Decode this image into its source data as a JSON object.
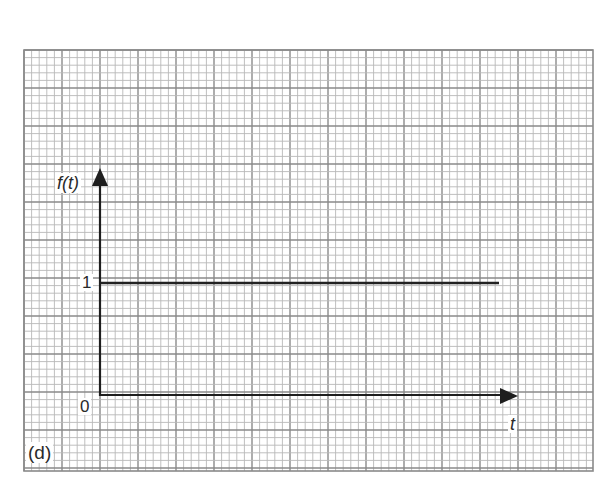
{
  "figure": {
    "panel_label": "(d)",
    "y_axis_label": "f(t)",
    "x_axis_label": "t",
    "y_tick_labels": [
      {
        "text": "1",
        "value": 1
      },
      {
        "text": "0",
        "value": 0
      }
    ]
  },
  "grid": {
    "left": 24,
    "top": 50,
    "right": 593,
    "bottom": 471,
    "minor_pitch": 7.6,
    "major_every": 5,
    "minor_color": "#b8b8b8",
    "major_color": "#8a8a8a"
  },
  "axes": {
    "origin_x": 100,
    "origin_y": 395,
    "y_top": 168,
    "x_right": 518,
    "color": "#1e1e1e"
  },
  "signal": {
    "description": "Constant function f(t)=1 for t>=0",
    "color": "#222222",
    "x_start": 100,
    "x_end": 499,
    "y": 283
  },
  "chart_data": {
    "type": "line",
    "title": "",
    "panel": "(d)",
    "xlabel": "t",
    "ylabel": "f(t)",
    "y_ticks": [
      0,
      1
    ],
    "grid": true,
    "series": [
      {
        "name": "f(t)",
        "x": [
          0,
          1
        ],
        "y": [
          1,
          1
        ],
        "note": "step/unit constant: f(t)=1 for t>=0 extending right"
      }
    ]
  }
}
